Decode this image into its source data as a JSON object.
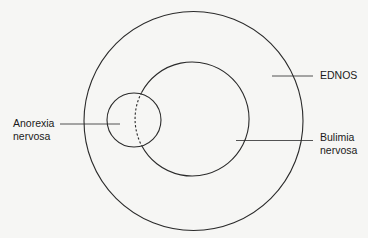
{
  "diagram": {
    "type": "nested-circles",
    "colors": {
      "stroke": "#2a2a2a",
      "background": "#f6f6f4",
      "text": "#1a1a1a"
    },
    "labels": {
      "ednos": "EDNOS",
      "bulimia_line1": "Bulimia",
      "bulimia_line2": "nervosa",
      "anorexia_line1": "Anorexia",
      "anorexia_line2": "nervosa"
    }
  }
}
